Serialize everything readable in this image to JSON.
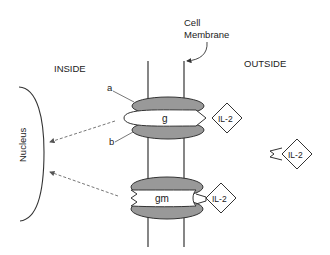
{
  "labels": {
    "cell_membrane_line1": "Cell",
    "cell_membrane_line2": "Membrane",
    "inside": "INSIDE",
    "outside": "OUTSIDE",
    "nucleus": "Nucleus",
    "subunit_a": "a",
    "subunit_b": "b"
  },
  "receptors": [
    {
      "label": "g",
      "ligand": "IL-2"
    },
    {
      "label": "gm",
      "ligand": "IL-2"
    }
  ],
  "free_ligand": {
    "label": "IL-2"
  },
  "colors": {
    "line": "#333333",
    "subunit_fill": "#999999",
    "core_fill": "#ffffff",
    "arrow": "#666666"
  }
}
